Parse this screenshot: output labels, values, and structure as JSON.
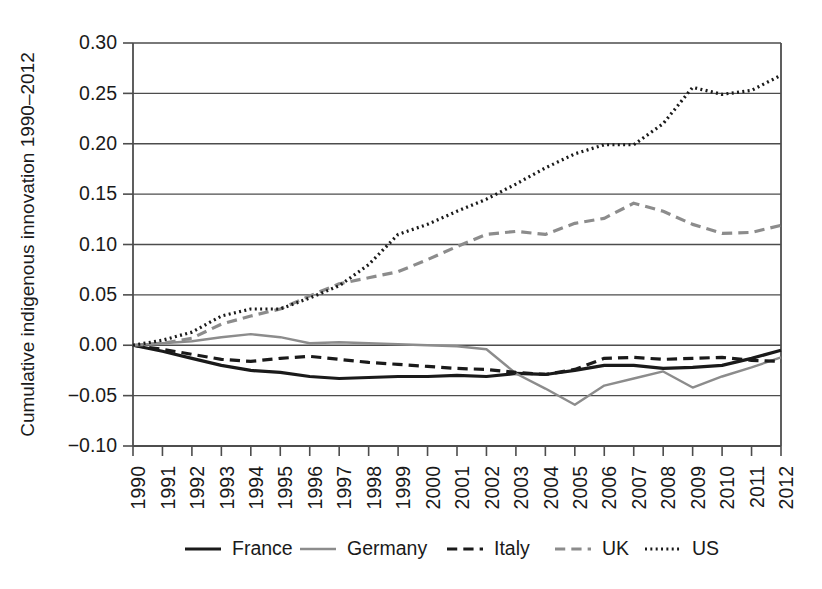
{
  "chart_data": {
    "type": "line",
    "title": "",
    "xlabel": "",
    "ylabel": "Cumulative indigenous innovation 1990–2012",
    "x": [
      1990,
      1991,
      1992,
      1993,
      1994,
      1995,
      1996,
      1997,
      1998,
      1999,
      2000,
      2001,
      2002,
      2003,
      2004,
      2005,
      2006,
      2007,
      2008,
      2009,
      2010,
      2011,
      2012
    ],
    "xtick_labels": [
      "1990",
      "1991",
      "1992",
      "1993",
      "1994",
      "1995",
      "1996",
      "1997",
      "1998",
      "1999",
      "2000",
      "2001",
      "2002",
      "2003",
      "2004",
      "2005",
      "2006",
      "2007",
      "2008",
      "2009",
      "2010",
      "2011",
      "2012"
    ],
    "ytick_labels": [
      "0.30",
      "0.25",
      "0.20",
      "0.15",
      "0.10",
      "0.05",
      "0.00",
      "−0.05",
      "−0.10"
    ],
    "ytick_values": [
      0.3,
      0.25,
      0.2,
      0.15,
      0.1,
      0.05,
      0.0,
      -0.05,
      -0.1
    ],
    "ylim": [
      -0.1,
      0.3
    ],
    "xlim": [
      1990,
      2012
    ],
    "grid": true,
    "legend_position": "bottom",
    "series": [
      {
        "name": "France",
        "style": "solid",
        "color": "#1a1a1a",
        "width": 3.2,
        "values": [
          0.0,
          -0.006,
          -0.013,
          -0.02,
          -0.025,
          -0.027,
          -0.031,
          -0.033,
          -0.032,
          -0.031,
          -0.031,
          -0.03,
          -0.031,
          -0.028,
          -0.029,
          -0.025,
          -0.02,
          -0.02,
          -0.023,
          -0.022,
          -0.02,
          -0.013,
          -0.005
        ]
      },
      {
        "name": "Germany",
        "style": "solid",
        "color": "#8c8c8c",
        "width": 2.4,
        "values": [
          0.0,
          0.002,
          0.004,
          0.008,
          0.011,
          0.008,
          0.002,
          0.003,
          0.002,
          0.001,
          0.0,
          -0.001,
          -0.004,
          -0.028,
          -0.043,
          -0.059,
          -0.04,
          -0.033,
          -0.026,
          -0.042,
          -0.031,
          -0.022,
          -0.012
        ]
      },
      {
        "name": "Italy",
        "style": "dashed",
        "color": "#1a1a1a",
        "width": 3.2,
        "values": [
          0.0,
          -0.004,
          -0.009,
          -0.014,
          -0.016,
          -0.013,
          -0.011,
          -0.014,
          -0.017,
          -0.019,
          -0.021,
          -0.023,
          -0.024,
          -0.027,
          -0.029,
          -0.024,
          -0.013,
          -0.012,
          -0.014,
          -0.013,
          -0.012,
          -0.015,
          -0.016
        ]
      },
      {
        "name": "UK",
        "style": "dashed",
        "color": "#8c8c8c",
        "width": 3.2,
        "values": [
          0.0,
          0.002,
          0.007,
          0.021,
          0.029,
          0.036,
          0.049,
          0.061,
          0.067,
          0.073,
          0.085,
          0.098,
          0.11,
          0.113,
          0.11,
          0.121,
          0.126,
          0.141,
          0.133,
          0.12,
          0.111,
          0.112,
          0.119
        ]
      },
      {
        "name": "US",
        "style": "dotted",
        "color": "#1a1a1a",
        "width": 3.2,
        "values": [
          0.0,
          0.005,
          0.013,
          0.029,
          0.036,
          0.036,
          0.047,
          0.059,
          0.08,
          0.11,
          0.12,
          0.133,
          0.145,
          0.16,
          0.176,
          0.19,
          0.199,
          0.199,
          0.22,
          0.256,
          0.249,
          0.253,
          0.268
        ]
      }
    ]
  },
  "legend": {
    "entries": [
      {
        "label": "France"
      },
      {
        "label": "Germany"
      },
      {
        "label": "Italy"
      },
      {
        "label": "UK"
      },
      {
        "label": "US"
      }
    ]
  }
}
